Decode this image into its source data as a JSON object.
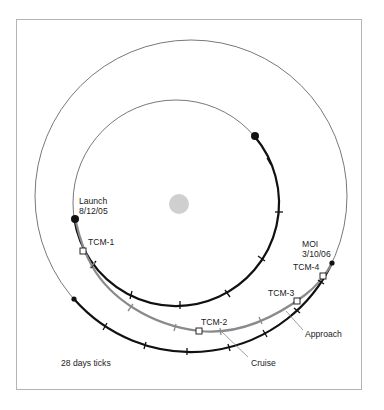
{
  "diagram": {
    "title": "",
    "labels": {
      "launch": "Launch",
      "launch_date": "8/12/05",
      "moi": "MOI",
      "moi_date": "3/10/06",
      "tcm1": "TCM-1",
      "tcm2": "TCM-2",
      "tcm3": "TCM-3",
      "tcm4": "TCM-4",
      "cruise": "Cruise",
      "approach": "Approach",
      "legend": "28 days ticks"
    },
    "colors": {
      "orbit_thin": "#555555",
      "orbit_thick": "#111111",
      "transfer": "#8a8a8a",
      "sun": "#cfcfcf",
      "frame": "#b4b4b4",
      "text": "#222222"
    },
    "bodies": {
      "sun": {
        "cx": 179,
        "cy": 204,
        "r": 10
      },
      "inner_orbit": {
        "name": "Earth orbit",
        "cx": 176,
        "cy": 203,
        "r": 103
      },
      "outer_orbit": {
        "name": "Mars orbit",
        "cx": 191,
        "cy": 196,
        "r": 156
      }
    },
    "events": [
      {
        "id": "launch",
        "x": 75,
        "y": 219
      },
      {
        "id": "tcm1",
        "x": 83,
        "y": 251
      },
      {
        "id": "tcm2",
        "x": 199,
        "y": 331
      },
      {
        "id": "tcm3",
        "x": 297,
        "y": 301
      },
      {
        "id": "tcm4",
        "x": 323,
        "y": 276
      },
      {
        "id": "moi",
        "x": 332,
        "y": 263
      }
    ]
  }
}
